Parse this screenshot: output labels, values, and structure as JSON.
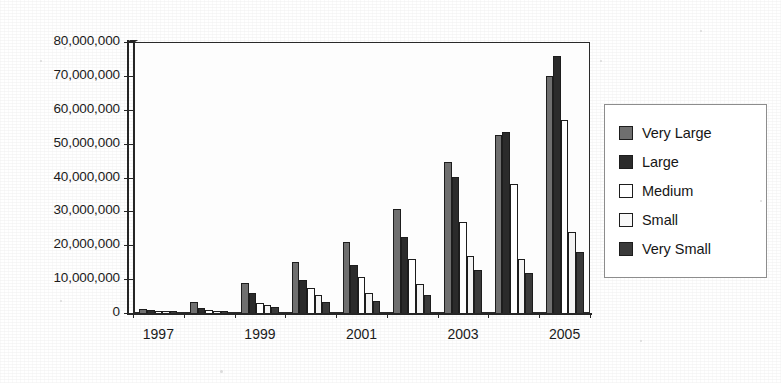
{
  "chart_data": {
    "type": "bar",
    "title": "",
    "subtitle": "",
    "xlabel": "",
    "ylabel": "",
    "grid": true,
    "legend_position": "right",
    "ylim": [
      0,
      80000000
    ],
    "ytick_labels": [
      "80,000,000",
      "70,000,000",
      "60,000,000",
      "50,000,000",
      "40,000,000",
      "30,000,000",
      "20,000,000",
      "10,000,000",
      "0"
    ],
    "ytick_values": [
      80000000,
      70000000,
      60000000,
      50000000,
      40000000,
      30000000,
      20000000,
      10000000,
      0
    ],
    "categories": [
      "1997",
      "1998",
      "1999",
      "2000",
      "2001",
      "2002",
      "2003",
      "2004",
      "2005"
    ],
    "visible_xtick_labels": [
      "1997",
      "1999",
      "2001",
      "2003",
      "2005"
    ],
    "series": [
      {
        "name": "Very Large",
        "color": "#6f6f6f",
        "values": [
          1200000,
          3200000,
          9000000,
          15200000,
          21000000,
          30800000,
          44500000,
          52500000,
          70000000
        ]
      },
      {
        "name": "Large",
        "color": "#2b2b2b",
        "values": [
          900000,
          1500000,
          6000000,
          9600000,
          14200000,
          22500000,
          40200000,
          53500000,
          76000000
        ]
      },
      {
        "name": "Medium",
        "color": "#ffffff",
        "values": [
          600000,
          900000,
          3000000,
          7400000,
          10600000,
          16000000,
          27000000,
          38000000,
          57000000
        ]
      },
      {
        "name": "Small",
        "color": "#f4f4f4",
        "values": [
          400000,
          700000,
          2400000,
          5200000,
          6000000,
          8600000,
          16800000,
          15800000,
          24000000
        ]
      },
      {
        "name": "Very Small",
        "color": "#3a3a3a",
        "values": [
          300000,
          600000,
          1700000,
          3200000,
          3600000,
          5400000,
          12600000,
          11800000,
          18000000
        ]
      }
    ]
  },
  "legend": {
    "items": [
      {
        "label": "Very Large",
        "swatch": "#6f6f6f"
      },
      {
        "label": "Large",
        "swatch": "#2b2b2b"
      },
      {
        "label": "Medium",
        "swatch": "#ffffff"
      },
      {
        "label": "Small",
        "swatch": "#f8f8f8"
      },
      {
        "label": "Very Small",
        "swatch": "#3a3a3a"
      }
    ]
  }
}
